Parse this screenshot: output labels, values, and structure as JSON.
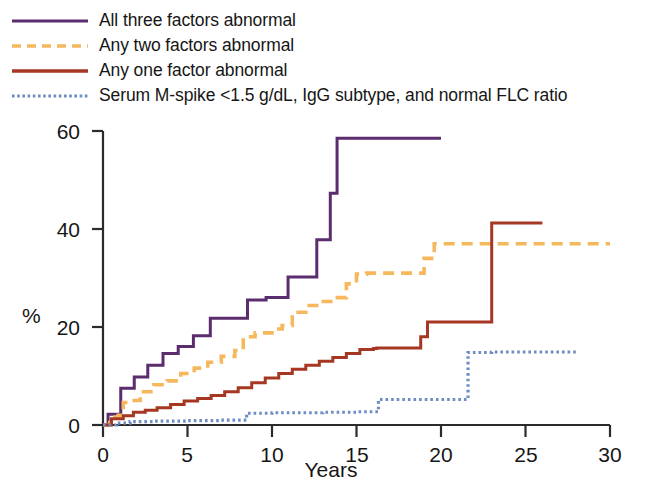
{
  "legend": {
    "position": "top-left",
    "items": [
      {
        "label": "All three factors abnormal",
        "color": "#5b2d6e",
        "style": "solid",
        "icon": "legend-line-solid-purple"
      },
      {
        "label": "Any two factors abnormal",
        "color": "#f6b85c",
        "style": "dashed",
        "icon": "legend-line-dashed-orange"
      },
      {
        "label": "Any one factor abnormal",
        "color": "#a63722",
        "style": "solid",
        "icon": "legend-line-solid-darkred"
      },
      {
        "label": "Serum M-spike <1.5 g/dL, IgG subtype, and normal FLC ratio",
        "color": "#6e8cc4",
        "style": "dotted",
        "icon": "legend-line-dotted-blue"
      }
    ]
  },
  "axes": {
    "ylabel": "%",
    "xlabel": "Years",
    "yticks": [
      "0",
      "20",
      "40",
      "60"
    ],
    "xticks": [
      "0",
      "5",
      "10",
      "15",
      "20",
      "25",
      "30"
    ]
  },
  "chart_data": {
    "type": "line",
    "title": "",
    "subtitle": "",
    "xlabel": "Years",
    "ylabel": "%",
    "xlim": [
      0,
      30
    ],
    "ylim": [
      0,
      60
    ],
    "grid": false,
    "legend_position": "top-left",
    "curve_style": "step (Kaplan-Meier cumulative incidence)",
    "series": [
      {
        "name": "All three factors abnormal",
        "color": "#5b2d6e",
        "linestyle": "solid",
        "points": [
          [
            0,
            0
          ],
          [
            0.3,
            2.2
          ],
          [
            1.0,
            2.2
          ],
          [
            1.05,
            7.5
          ],
          [
            1.8,
            7.5
          ],
          [
            1.85,
            9.8
          ],
          [
            2.6,
            9.8
          ],
          [
            2.65,
            12.2
          ],
          [
            3.5,
            12.2
          ],
          [
            3.55,
            14.6
          ],
          [
            4.4,
            14.6
          ],
          [
            4.45,
            16.0
          ],
          [
            5.3,
            16.0
          ],
          [
            5.35,
            18.2
          ],
          [
            6.3,
            18.2
          ],
          [
            6.35,
            21.8
          ],
          [
            8.5,
            21.8
          ],
          [
            8.55,
            25.5
          ],
          [
            9.6,
            25.5
          ],
          [
            9.65,
            26.0
          ],
          [
            10.9,
            26.0
          ],
          [
            10.95,
            30.2
          ],
          [
            12.6,
            30.2
          ],
          [
            12.65,
            37.8
          ],
          [
            13.4,
            37.8
          ],
          [
            13.45,
            47.3
          ],
          [
            13.8,
            47.3
          ],
          [
            13.85,
            58.5
          ],
          [
            20.0,
            58.5
          ]
        ]
      },
      {
        "name": "Any two factors abnormal",
        "color": "#f6b85c",
        "linestyle": "dashed",
        "points": [
          [
            0,
            0
          ],
          [
            0.4,
            1.6
          ],
          [
            0.9,
            2.0
          ],
          [
            1.2,
            4.6
          ],
          [
            1.6,
            5.0
          ],
          [
            2.2,
            6.8
          ],
          [
            3.0,
            8.2
          ],
          [
            3.8,
            9.0
          ],
          [
            4.6,
            10.5
          ],
          [
            5.4,
            11.6
          ],
          [
            6.2,
            12.8
          ],
          [
            7.0,
            14.0
          ],
          [
            7.8,
            15.2
          ],
          [
            8.3,
            18.0
          ],
          [
            9.0,
            18.8
          ],
          [
            10.0,
            19.6
          ],
          [
            10.6,
            20.3
          ],
          [
            11.2,
            23.0
          ],
          [
            12.0,
            24.4
          ],
          [
            12.9,
            25.2
          ],
          [
            13.6,
            26.0
          ],
          [
            14.4,
            28.8
          ],
          [
            15.0,
            30.8
          ],
          [
            15.6,
            31.0
          ],
          [
            17.0,
            31.0
          ],
          [
            18.8,
            31.0
          ],
          [
            19.0,
            34.0
          ],
          [
            19.6,
            37.0
          ],
          [
            20.2,
            37.0
          ],
          [
            23.0,
            37.0
          ],
          [
            26.0,
            37.0
          ],
          [
            30.0,
            37.0
          ]
        ]
      },
      {
        "name": "Any one factor abnormal",
        "color": "#a63722",
        "linestyle": "solid",
        "points": [
          [
            0,
            0
          ],
          [
            0.5,
            1.3
          ],
          [
            1.2,
            1.9
          ],
          [
            1.8,
            2.6
          ],
          [
            2.5,
            3.0
          ],
          [
            3.2,
            3.5
          ],
          [
            4.0,
            4.2
          ],
          [
            4.8,
            4.9
          ],
          [
            5.6,
            5.4
          ],
          [
            6.4,
            6.0
          ],
          [
            7.2,
            6.8
          ],
          [
            8.0,
            7.6
          ],
          [
            8.8,
            8.6
          ],
          [
            9.6,
            9.6
          ],
          [
            10.4,
            10.5
          ],
          [
            11.2,
            11.4
          ],
          [
            12.0,
            12.2
          ],
          [
            12.8,
            13.0
          ],
          [
            13.6,
            13.8
          ],
          [
            14.4,
            14.6
          ],
          [
            15.2,
            15.4
          ],
          [
            16.0,
            15.6
          ],
          [
            16.2,
            15.7
          ],
          [
            17.0,
            15.7
          ],
          [
            18.6,
            15.7
          ],
          [
            18.8,
            18.0
          ],
          [
            19.2,
            21.0
          ],
          [
            20.0,
            21.0
          ],
          [
            22.9,
            21.0
          ],
          [
            23.0,
            41.2
          ],
          [
            26.0,
            41.2
          ]
        ]
      },
      {
        "name": "Serum M-spike <1.5 g/dL, IgG subtype, and normal FLC ratio",
        "color": "#6e8cc4",
        "linestyle": "dotted",
        "points": [
          [
            0,
            0
          ],
          [
            0.8,
            0.4
          ],
          [
            1.6,
            0.7
          ],
          [
            3.0,
            0.8
          ],
          [
            5.0,
            0.9
          ],
          [
            7.0,
            1.0
          ],
          [
            8.4,
            1.0
          ],
          [
            8.5,
            2.4
          ],
          [
            10.0,
            2.5
          ],
          [
            13.0,
            2.6
          ],
          [
            15.0,
            2.7
          ],
          [
            16.2,
            2.7
          ],
          [
            16.3,
            5.2
          ],
          [
            18.0,
            5.2
          ],
          [
            20.0,
            5.2
          ],
          [
            21.5,
            5.2
          ],
          [
            21.6,
            14.8
          ],
          [
            23.0,
            14.9
          ],
          [
            25.0,
            14.9
          ],
          [
            28.0,
            14.9
          ]
        ]
      }
    ]
  }
}
